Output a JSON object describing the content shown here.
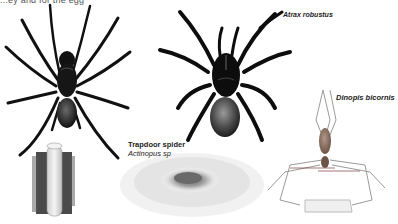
{
  "page": {
    "cut_text_top": "...ey and for the egg",
    "cut_text_top_right": "..."
  },
  "labels": {
    "atrax": "Atrax robustus",
    "trapdoor_common": "Trapdoor spider",
    "trapdoor_scientific": "Actinopus sp",
    "dinopis": "Dinopis bicornis"
  },
  "illustrations": [
    {
      "name": "trapdoor-spider",
      "description": "Black trapdoor spider, dorsal view"
    },
    {
      "name": "trapdoor-burrow",
      "description": "Silk-lined burrow tube in soil"
    },
    {
      "name": "atrax-spider",
      "description": "Sydney funnel-web spider, dorsal view"
    },
    {
      "name": "funnel-web-burrow",
      "description": "Funnel web burrow entrance"
    },
    {
      "name": "dinopis-spider",
      "description": "Net-casting spider holding web"
    }
  ],
  "colors": {
    "ink": "#111111",
    "abdomen": "#5a5a5a",
    "dinopis_body": "#8a6e60",
    "background": "#ffffff"
  }
}
